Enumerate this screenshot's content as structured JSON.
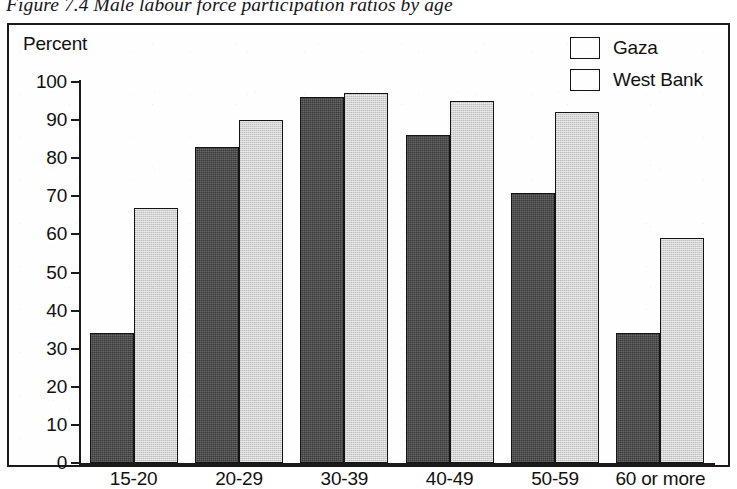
{
  "figure": {
    "caption": "Figure 7.4 Male labour force participation ratios by age"
  },
  "axis": {
    "y_title": "Percent",
    "y_ticks": [
      "100",
      "90",
      "80",
      "70",
      "60",
      "50",
      "40",
      "30",
      "20",
      "10",
      "0"
    ]
  },
  "legend": {
    "items": [
      {
        "label": "Gaza",
        "color": "#3a3a3a",
        "key": "gaza"
      },
      {
        "label": "West Bank",
        "color": "#d2d2d2",
        "key": "westbank"
      }
    ]
  },
  "chart_data": {
    "type": "bar",
    "title": "Figure 7.4 Male labour force participation ratios by age",
    "xlabel": "",
    "ylabel": "Percent",
    "ylim": [
      0,
      100
    ],
    "ytick_step": 10,
    "grid": false,
    "legend_position": "top-right",
    "categories": [
      "15-20",
      "20-29",
      "30-39",
      "40-49",
      "50-59",
      "60 or more"
    ],
    "series": [
      {
        "name": "Gaza",
        "color": "#3a3a3a",
        "values": [
          34,
          83,
          96,
          86,
          71,
          34
        ]
      },
      {
        "name": "West Bank",
        "color": "#d2d2d2",
        "values": [
          67,
          90,
          97,
          95,
          92,
          59
        ]
      }
    ]
  }
}
